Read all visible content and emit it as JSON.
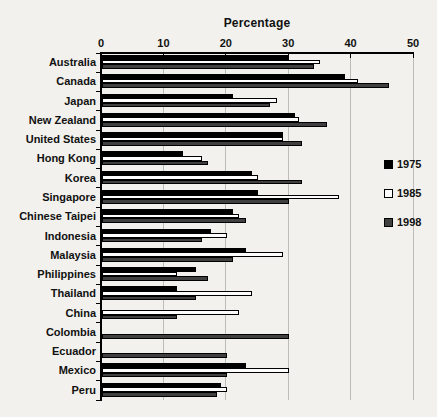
{
  "chart_data": {
    "type": "bar",
    "orientation": "horizontal",
    "title": "Percentage",
    "xlabel": "Percentage",
    "ylabel": "",
    "xlim": [
      0,
      50
    ],
    "xticks": [
      0,
      10,
      20,
      30,
      40,
      50
    ],
    "grid": true,
    "legend_position": "right",
    "plot_bg": "#f2f1ee",
    "gridline_color": "#bcbcb8",
    "categories": [
      "Australia",
      "Canada",
      "Japan",
      "New Zealand",
      "United States",
      "Hong Kong",
      "Korea",
      "Singapore",
      "Chinese Taipei",
      "Indonesia",
      "Malaysia",
      "Philippines",
      "Thailand",
      "China",
      "Colombia",
      "Ecuador",
      "Mexico",
      "Peru"
    ],
    "series": [
      {
        "name": "1975",
        "fill": "#000000",
        "border": "#000000",
        "values": [
          30,
          39,
          21,
          31,
          29,
          13,
          24,
          25,
          21,
          17.5,
          23,
          15,
          12,
          null,
          null,
          null,
          23,
          19
        ]
      },
      {
        "name": "1985",
        "fill": "#fdfdfd",
        "border": "#000000",
        "values": [
          35,
          41,
          28,
          31.5,
          29,
          16,
          25,
          38,
          22,
          20,
          29,
          12,
          24,
          22,
          null,
          null,
          30,
          20
        ]
      },
      {
        "name": "1998",
        "fill": "#404040",
        "border": "#000000",
        "values": [
          34,
          46,
          27,
          36,
          32,
          17,
          32,
          30,
          23,
          16,
          21,
          17,
          15,
          12,
          30,
          20,
          20,
          18.5
        ]
      }
    ]
  }
}
